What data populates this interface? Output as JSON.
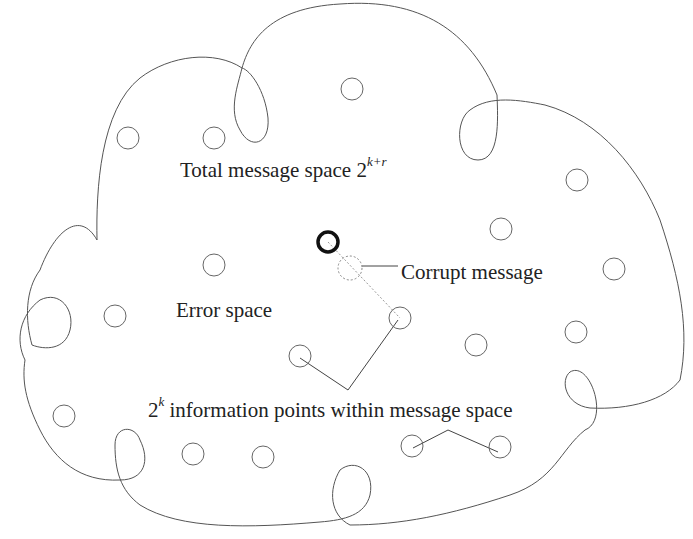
{
  "diagram": {
    "labels": {
      "total_space": "Total message space 2",
      "total_space_exp": "k+r",
      "corrupt": "Corrupt message",
      "error_space": "Error space",
      "info_points_base": "2",
      "info_points_exp": "k",
      "info_points": " information points within message space"
    },
    "colors": {
      "outline": "#555555",
      "circle": "#666666",
      "bold_circle": "#111111",
      "text": "#222222"
    },
    "points": [
      {
        "x": 352,
        "y": 89
      },
      {
        "x": 128,
        "y": 138
      },
      {
        "x": 214,
        "y": 138
      },
      {
        "x": 577,
        "y": 180
      },
      {
        "x": 501,
        "y": 229
      },
      {
        "x": 214,
        "y": 265
      },
      {
        "x": 614,
        "y": 269
      },
      {
        "x": 115,
        "y": 316
      },
      {
        "x": 400,
        "y": 318
      },
      {
        "x": 300,
        "y": 356
      },
      {
        "x": 476,
        "y": 345
      },
      {
        "x": 576,
        "y": 332
      },
      {
        "x": 64,
        "y": 416
      },
      {
        "x": 193,
        "y": 454
      },
      {
        "x": 263,
        "y": 457
      },
      {
        "x": 412,
        "y": 446
      },
      {
        "x": 500,
        "y": 447
      }
    ],
    "sent_message": {
      "x": 328,
      "y": 242
    },
    "corrupt_message": {
      "x": 350,
      "y": 268
    }
  }
}
